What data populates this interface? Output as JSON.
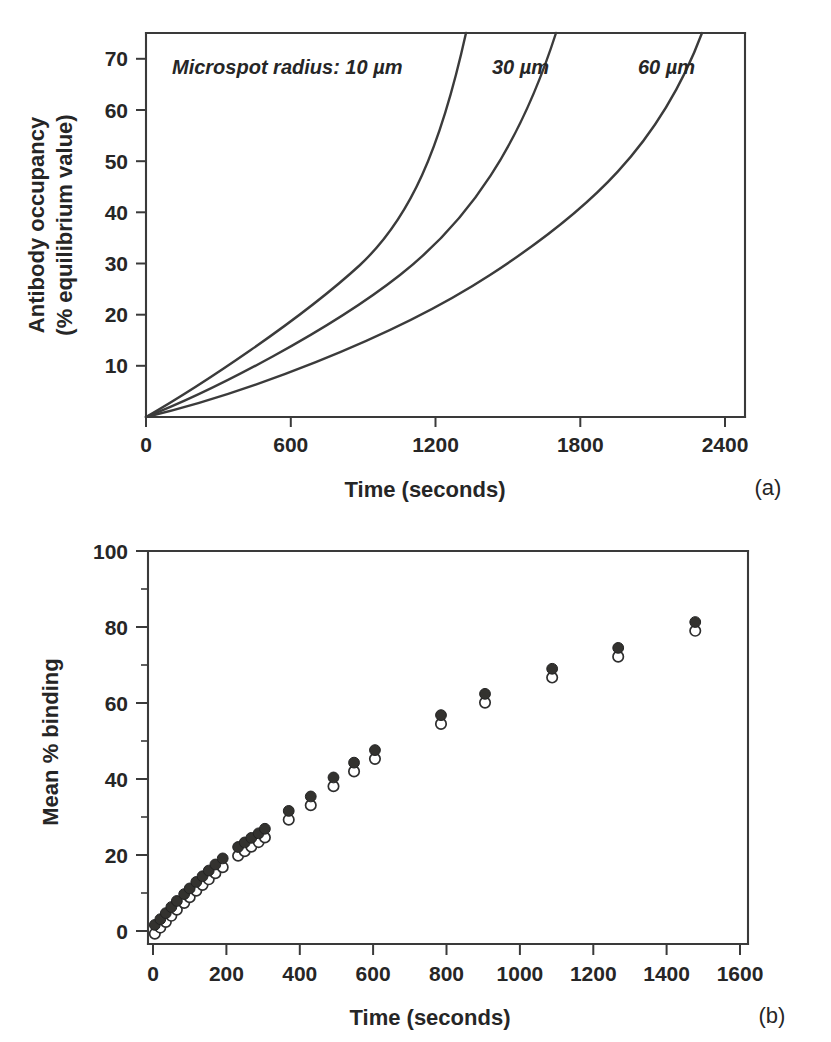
{
  "figure": {
    "panel_a_tag": "(a)",
    "panel_b_tag": "(b)"
  },
  "panel_a": {
    "annotation_prefix": "Microspot radius: 10 µm",
    "label_30": "30 µm",
    "label_60": "60 µm",
    "xlabel": "Time (seconds)",
    "ylabel_line1": "Antibody occupancy",
    "ylabel_line2": "(% equilibrium value)",
    "xticks": [
      "0",
      "600",
      "1200",
      "1800",
      "2400"
    ],
    "yticks": [
      "10",
      "20",
      "30",
      "40",
      "50",
      "60",
      "70"
    ]
  },
  "panel_b": {
    "xlabel": "Time (seconds)",
    "ylabel": "Mean % binding",
    "xticks": [
      "0",
      "200",
      "400",
      "600",
      "800",
      "1000",
      "1200",
      "1400",
      "1600"
    ],
    "yticks": [
      "0",
      "20",
      "40",
      "60",
      "80",
      "100"
    ]
  },
  "chart_data": [
    {
      "type": "line",
      "panel": "(a)",
      "title": "",
      "xlabel": "Time (seconds)",
      "ylabel": "Antibody occupancy (% equilibrium value)",
      "xlim": [
        0,
        2400
      ],
      "ylim": [
        0,
        75
      ],
      "xticks": [
        0,
        600,
        1200,
        1800,
        2400
      ],
      "yticks": [
        0,
        10,
        20,
        30,
        40,
        50,
        60,
        70
      ],
      "grid": false,
      "legend": "inline annotations at top of axes",
      "annotations": [
        "Microspot radius: 10 µm",
        "30 µm",
        "60 µm"
      ],
      "series": [
        {
          "name": "10 µm",
          "x": [
            0,
            100,
            200,
            300,
            400,
            500,
            600,
            700,
            800,
            900,
            1000,
            1100,
            1200,
            1300,
            1400,
            1450
          ],
          "y": [
            0,
            6.5,
            12.8,
            18.8,
            24.5,
            29.9,
            35.0,
            39.8,
            44.4,
            48.7,
            52.8,
            56.6,
            60.3,
            63.8,
            71.2,
            75.0
          ]
        },
        {
          "name": "30 µm",
          "x": [
            0,
            100,
            200,
            300,
            400,
            500,
            600,
            700,
            800,
            900,
            1000,
            1100,
            1200,
            1300,
            1400,
            1500,
            1600,
            1700,
            1750
          ],
          "y": [
            0,
            5.6,
            11.0,
            16.2,
            21.2,
            26.0,
            30.6,
            35.0,
            39.2,
            43.2,
            47.1,
            50.8,
            54.3,
            57.7,
            61.0,
            64.1,
            67.0,
            72.0,
            75.0
          ]
        },
        {
          "name": "60 µm",
          "x": [
            0,
            100,
            200,
            300,
            400,
            500,
            600,
            700,
            800,
            900,
            1000,
            1100,
            1200,
            1300,
            1400,
            1500,
            1600,
            1700,
            1800,
            1900,
            2000,
            2100,
            2200,
            2260
          ],
          "y": [
            0,
            4.6,
            9.1,
            13.4,
            17.6,
            21.6,
            25.5,
            29.3,
            32.9,
            36.4,
            39.8,
            43.0,
            46.2,
            49.2,
            52.1,
            54.9,
            57.6,
            60.2,
            62.8,
            65.2,
            67.6,
            69.9,
            73.5,
            75.0
          ]
        }
      ]
    },
    {
      "type": "scatter",
      "panel": "(b)",
      "title": "",
      "xlabel": "Time (seconds)",
      "ylabel": "Mean % binding",
      "xlim": [
        0,
        1600
      ],
      "ylim": [
        0,
        100
      ],
      "xticks": [
        0,
        200,
        400,
        600,
        800,
        1000,
        1200,
        1400,
        1600
      ],
      "yticks": [
        0,
        20,
        40,
        60,
        80,
        100
      ],
      "grid": false,
      "legend": "none",
      "series": [
        {
          "name": "filled marker series",
          "marker": "filled-circle",
          "x": [
            5,
            20,
            35,
            50,
            65,
            85,
            100,
            118,
            135,
            152,
            170,
            190,
            232,
            250,
            268,
            288,
            305,
            370,
            430,
            492,
            548,
            605,
            785,
            905,
            1088,
            1268,
            1478
          ],
          "y": [
            0.5,
            2.0,
            3.6,
            5.2,
            6.8,
            8.6,
            10.1,
            11.8,
            13.3,
            14.8,
            16.4,
            18.0,
            21.0,
            22.2,
            23.4,
            24.6,
            25.8,
            30.5,
            34.3,
            39.3,
            43.2,
            46.5,
            55.7,
            61.3,
            67.9,
            73.4,
            80.2
          ]
        },
        {
          "name": "open circle series",
          "marker": "open-circle",
          "x": [
            5,
            20,
            35,
            50,
            65,
            85,
            100,
            118,
            135,
            152,
            170,
            190,
            232,
            250,
            268,
            288,
            305,
            370,
            430,
            492,
            548,
            605,
            785,
            905,
            1088,
            1268,
            1478
          ],
          "y": [
            -0.7,
            0.9,
            2.4,
            4.0,
            5.6,
            7.4,
            8.9,
            10.6,
            12.1,
            13.6,
            15.2,
            16.8,
            19.8,
            21.0,
            22.2,
            23.4,
            24.6,
            29.3,
            33.1,
            38.1,
            42.0,
            45.3,
            54.5,
            60.1,
            66.7,
            72.2,
            79.0
          ]
        }
      ]
    }
  ]
}
